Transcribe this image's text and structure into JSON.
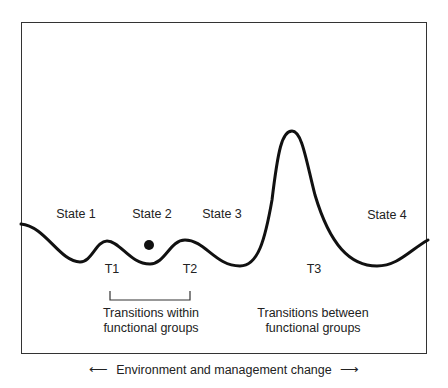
{
  "diagram": {
    "states": [
      {
        "label": "State 1",
        "x": 76,
        "y": 207
      },
      {
        "label": "State 2",
        "x": 152,
        "y": 207
      },
      {
        "label": "State 3",
        "x": 222,
        "y": 207
      },
      {
        "label": "State 4",
        "x": 387,
        "y": 208
      }
    ],
    "transitions": [
      {
        "label": "T1",
        "x": 112,
        "y": 261
      },
      {
        "label": "T2",
        "x": 190,
        "y": 261
      },
      {
        "label": "T3",
        "x": 314,
        "y": 261
      }
    ],
    "group_labels": {
      "within_line1": "Transitions within",
      "within_line2": "functional groups",
      "between_line1": "Transitions between",
      "between_line2": "functional groups"
    },
    "axis_caption": "Environment and management change",
    "arrow_left": "⟵",
    "arrow_right": "⟶",
    "ball_marker": "current-state-ball"
  }
}
